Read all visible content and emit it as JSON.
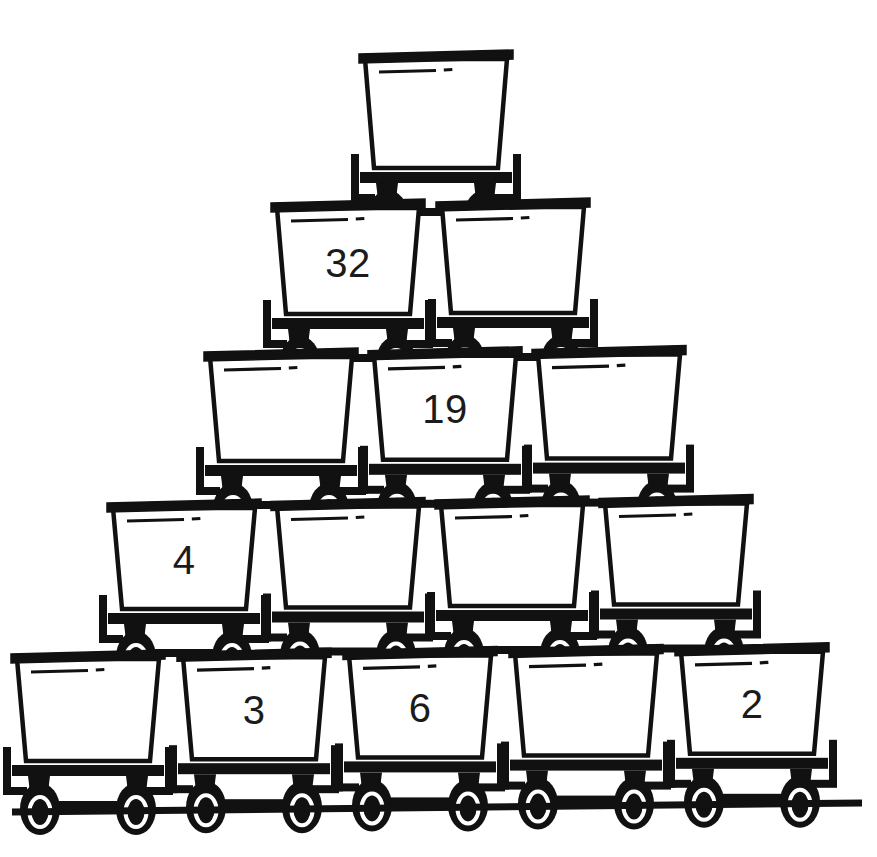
{
  "image": {
    "title": "Number pyramid of mine carts",
    "background_color": "#ffffff",
    "ink_color": "#111111",
    "number_color": "#1b1b1b",
    "width": 877,
    "height": 857
  },
  "ground": {
    "label": "ground-rail",
    "x1": 12,
    "x2": 862,
    "y_left": 812,
    "y_right": 803,
    "thickness": 7
  },
  "rows": [
    {
      "row_index": 1,
      "cart_count": 1,
      "chassis_y": 172,
      "box_top": 50,
      "box_left": 360,
      "cart_pitch": 0,
      "cart_width": 152,
      "tilt": 0,
      "carts": [
        {
          "id": "r1c1",
          "label": "",
          "filled": false
        }
      ]
    },
    {
      "row_index": 2,
      "cart_count": 2,
      "chassis_y": 318,
      "box_top": 199,
      "box_left": 272,
      "cart_pitch": 165,
      "cart_width": 152,
      "tilt": -1,
      "carts": [
        {
          "id": "r2c1",
          "label": "32",
          "filled": true
        },
        {
          "id": "r2c2",
          "label": "",
          "filled": false
        }
      ]
    },
    {
      "row_index": 3,
      "cart_count": 3,
      "chassis_y": 465,
      "box_top": 348,
      "box_left": 205,
      "cart_pitch": 164,
      "cart_width": 152,
      "tilt": -1.2,
      "carts": [
        {
          "id": "r3c1",
          "label": "",
          "filled": false
        },
        {
          "id": "r3c2",
          "label": "19",
          "filled": true
        },
        {
          "id": "r3c3",
          "label": "",
          "filled": false
        }
      ]
    },
    {
      "row_index": 4,
      "cart_count": 4,
      "chassis_y": 613,
      "box_top": 499,
      "box_left": 108,
      "cart_pitch": 164,
      "cart_width": 152,
      "tilt": -1.5,
      "carts": [
        {
          "id": "r4c1",
          "label": "4",
          "filled": true
        },
        {
          "id": "r4c2",
          "label": "",
          "filled": false
        },
        {
          "id": "r4c3",
          "label": "",
          "filled": false
        },
        {
          "id": "r4c4",
          "label": "",
          "filled": false
        }
      ]
    },
    {
      "row_index": 5,
      "cart_count": 5,
      "chassis_y": 765,
      "box_top": 650,
      "box_left": 12,
      "cart_pitch": 166,
      "cart_width": 152,
      "tilt": -1.8,
      "carts": [
        {
          "id": "r5c1",
          "label": "",
          "filled": false
        },
        {
          "id": "r5c2",
          "label": "3",
          "filled": true
        },
        {
          "id": "r5c3",
          "label": "6",
          "filled": true
        },
        {
          "id": "r5c4",
          "label": "",
          "filled": false
        },
        {
          "id": "r5c5",
          "label": "2",
          "filled": true
        }
      ]
    }
  ],
  "numbers_visible": [
    "32",
    "19",
    "4",
    "3",
    "6",
    "2"
  ],
  "cart_part_names": {
    "box": "cart-box",
    "top_rail": "cart-top-rail",
    "highlight": "cart-highlight-dash",
    "chassis": "cart-chassis-bar",
    "wheel": "cart-wheel",
    "buffer_left": "cart-buffer-left",
    "buffer_right": "cart-buffer-right",
    "brace": "cart-underframe-brace"
  }
}
